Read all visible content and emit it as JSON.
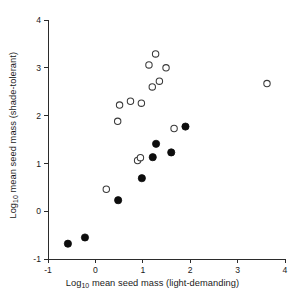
{
  "chart_data": {
    "type": "scatter",
    "title": "",
    "xlabel": "Log10 mean seed mass (light-demanding)",
    "ylabel": "Log10 mean seed mass (shade-tolerant)",
    "xlabel_prefix": "Log",
    "xlabel_sub": "10",
    "xlabel_rest": " mean seed mass (light-demanding)",
    "ylabel_prefix": "Log",
    "ylabel_sub": "10",
    "ylabel_rest": " mean seed mass (shade-tolerant)",
    "xlim": [
      -1,
      4
    ],
    "ylim": [
      -1,
      4
    ],
    "xticks": [
      -1,
      0,
      1,
      2,
      3,
      4
    ],
    "yticks": [
      -1,
      0,
      1,
      2,
      3,
      4
    ],
    "xticklabels": [
      "-1",
      "0",
      "1",
      "2",
      "3",
      "4"
    ],
    "yticklabels": [
      "-1",
      "0",
      "1",
      "2",
      "3",
      "4"
    ],
    "grid": false,
    "legend": null,
    "series": [
      {
        "name": "filled",
        "marker": "filled-circle",
        "color": "#0d0d0d",
        "points": [
          {
            "x": -0.58,
            "y": -0.68
          },
          {
            "x": -0.22,
            "y": -0.55
          },
          {
            "x": 0.48,
            "y": 0.23
          },
          {
            "x": 0.98,
            "y": 0.69
          },
          {
            "x": 1.21,
            "y": 1.13
          },
          {
            "x": 1.28,
            "y": 1.41
          },
          {
            "x": 1.6,
            "y": 1.23
          },
          {
            "x": 1.9,
            "y": 1.77
          }
        ]
      },
      {
        "name": "open",
        "marker": "open-circle",
        "color": "#3a3a3a",
        "points": [
          {
            "x": 0.23,
            "y": 0.46
          },
          {
            "x": 0.47,
            "y": 1.88
          },
          {
            "x": 0.51,
            "y": 2.22
          },
          {
            "x": 0.74,
            "y": 2.3
          },
          {
            "x": 0.89,
            "y": 1.06
          },
          {
            "x": 0.95,
            "y": 1.12
          },
          {
            "x": 0.97,
            "y": 2.26
          },
          {
            "x": 1.13,
            "y": 3.06
          },
          {
            "x": 1.2,
            "y": 2.6
          },
          {
            "x": 1.27,
            "y": 3.29
          },
          {
            "x": 1.35,
            "y": 2.72
          },
          {
            "x": 1.49,
            "y": 3.0
          },
          {
            "x": 1.66,
            "y": 1.73
          },
          {
            "x": 3.62,
            "y": 2.67
          }
        ]
      }
    ]
  }
}
